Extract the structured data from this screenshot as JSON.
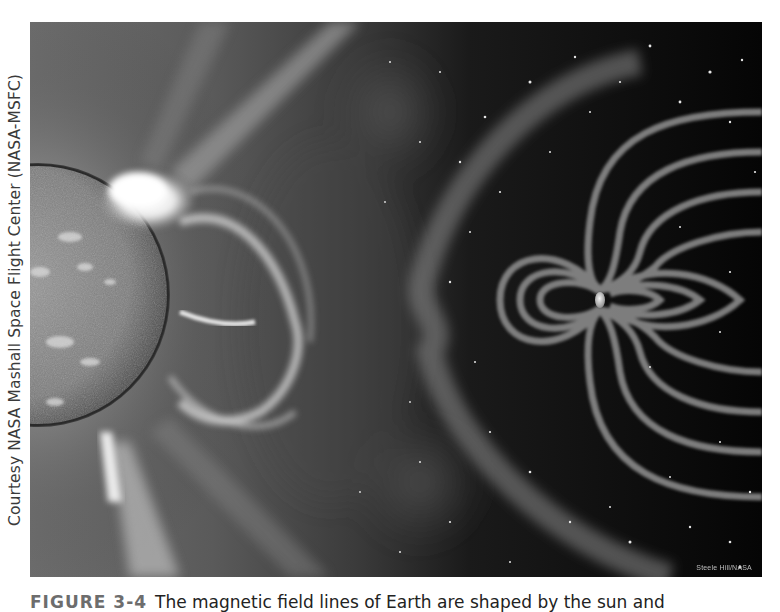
{
  "figure": {
    "side_credit": "Courtesy NASA Mashall Space Flight Center (NASA-MSFC)",
    "image_credit": "Steele Hill/NASA",
    "scene": {
      "description": "Coronal mass ejection from the Sun traveling toward Earth's magnetosphere",
      "elements": [
        "sun-limb",
        "solar-flare",
        "coronal-mass-ejection",
        "bow-shock",
        "magnetic-field-lines",
        "earth",
        "starfield"
      ]
    },
    "colors": {
      "space": "#0a0a0a",
      "corona": "#7a7a7a",
      "sun_surface": "#8a8a8a",
      "field_lines": "#8c8c8c",
      "flare": "#ffffff"
    }
  },
  "caption": {
    "label": "FIGURE 3-4",
    "text": "The magnetic field lines of Earth are shaped by the sun and"
  }
}
